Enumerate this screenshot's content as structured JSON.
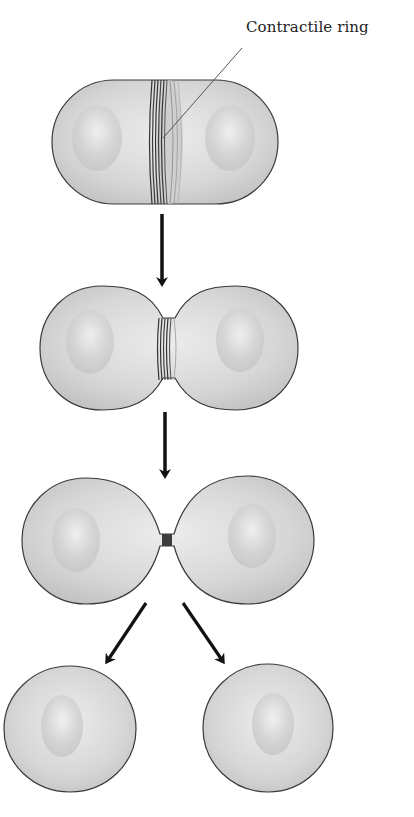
{
  "diagram": {
    "labels": {
      "contractile_ring": "Contractile ring"
    },
    "stages": [
      {
        "id": 1,
        "description": "Elongated cell with contractile ring around middle"
      },
      {
        "id": 2,
        "description": "Ring constricts, cell pinched into two lobes"
      },
      {
        "id": 3,
        "description": "Narrow cytoplasmic bridge between two cells"
      },
      {
        "id": 4,
        "description": "Two separated daughter cells"
      }
    ],
    "colors": {
      "cell_fill": "#d9d9d9",
      "cell_outline": "#3a3a3a",
      "ring": "#4a4a4a",
      "arrow": "#111111",
      "background": "#ffffff"
    }
  }
}
